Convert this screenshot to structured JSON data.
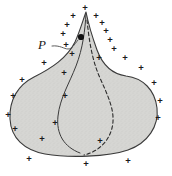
{
  "figure": {
    "caption_label": "P",
    "point_label": "P",
    "charge_symbol": "+",
    "colors": {
      "body_fill": "#d6d6d3",
      "outline": "#3a3a3a",
      "dashed_curve": "#2b2b2b",
      "inner_curve": "#3a3a3a",
      "point_marker": "#111111",
      "charge_sign": "#1a1a1a",
      "leader_line": "#4a4a4a",
      "background": "#ffffff",
      "texture_speckle": "#bfbfbb"
    },
    "body_outline_path": "M 86 12 C 88 22, 92 36, 97 50 C 103 66, 112 74, 126 76 C 143 78, 155 90, 157 108 C 159 126, 148 143, 128 150 C 108 157, 68 158, 45 154 C 24 150, 11 138, 10 119 C 9 100, 18 85, 34 77 C 52 68, 67 58, 75 42 C 80 31, 83 20, 86 12 Z",
    "inner_solid_path": "M 86 14 C 85 30, 83 48, 76 66 C 69 84, 60 98, 58 116 C 56 134, 64 147, 80 153",
    "dashed_curve_path": "M 87 20 C 89 40, 92 60, 100 78 C 108 96, 116 112, 112 128 C 108 144, 96 152, 84 155",
    "point_marker": {
      "x": 81,
      "y": 37,
      "r": 3.1
    },
    "leader_line_path": "M 52 46 C 60 45, 64 49, 68 49 C 72 49, 74 45, 78 40",
    "label_position": {
      "x": 42,
      "y": 44
    },
    "charges": [
      {
        "x": 85,
        "y": 7
      },
      {
        "x": 73,
        "y": 15
      },
      {
        "x": 96,
        "y": 15
      },
      {
        "x": 67,
        "y": 24
      },
      {
        "x": 102,
        "y": 22
      },
      {
        "x": 63,
        "y": 33
      },
      {
        "x": 106,
        "y": 30
      },
      {
        "x": 66,
        "y": 44
      },
      {
        "x": 110,
        "y": 39
      },
      {
        "x": 72,
        "y": 53
      },
      {
        "x": 114,
        "y": 48
      },
      {
        "x": 99,
        "y": 57
      },
      {
        "x": 44,
        "y": 62
      },
      {
        "x": 125,
        "y": 57
      },
      {
        "x": 64,
        "y": 72
      },
      {
        "x": 141,
        "y": 67
      },
      {
        "x": 22,
        "y": 79
      },
      {
        "x": 154,
        "y": 82
      },
      {
        "x": 13,
        "y": 95
      },
      {
        "x": 160,
        "y": 100
      },
      {
        "x": 65,
        "y": 95
      },
      {
        "x": 8,
        "y": 114
      },
      {
        "x": 158,
        "y": 117
      },
      {
        "x": 15,
        "y": 128
      },
      {
        "x": 55,
        "y": 122
      },
      {
        "x": 42,
        "y": 138
      },
      {
        "x": 29,
        "y": 158
      },
      {
        "x": 86,
        "y": 163
      },
      {
        "x": 128,
        "y": 160
      },
      {
        "x": 100,
        "y": 140
      }
    ]
  }
}
